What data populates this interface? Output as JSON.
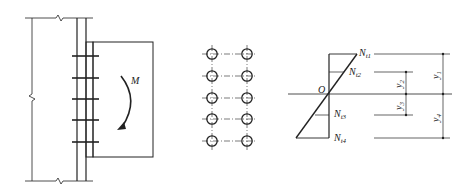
{
  "figure": {
    "panels": [
      {
        "id": "connection-elevation",
        "description": "Beam end plate bolted to column flange, moment M"
      },
      {
        "id": "bolt-layout",
        "description": "Two columns of five bolts"
      },
      {
        "id": "bolt-tension-distribution",
        "description": "Linear bolt tension distribution about neutral axis O"
      }
    ],
    "moment_label": "M",
    "neutral_axis_label": "O",
    "forces": [
      {
        "main": "N",
        "sub": "t1"
      },
      {
        "main": "N",
        "sub": "t2"
      },
      {
        "main": "N",
        "sub": "t3"
      },
      {
        "main": "N",
        "sub": "t4"
      }
    ],
    "distances": [
      {
        "main": "y",
        "sub": "1"
      },
      {
        "main": "y",
        "sub": "2"
      },
      {
        "main": "y",
        "sub": "3"
      },
      {
        "main": "y",
        "sub": "4"
      }
    ],
    "bolt_rows": 5,
    "bolt_columns": 2
  }
}
